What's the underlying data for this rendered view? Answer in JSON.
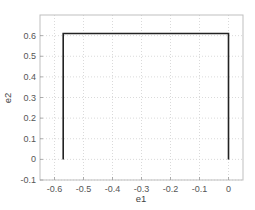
{
  "chart_data": {
    "type": "line",
    "title": "",
    "xlabel": "e1",
    "ylabel": "e2",
    "xlim": [
      -0.65,
      0.05
    ],
    "ylim": [
      -0.1,
      0.7
    ],
    "grid": true,
    "legend": null,
    "x_ticks": [
      -0.6,
      -0.5,
      -0.4,
      -0.3,
      -0.2,
      -0.1,
      0
    ],
    "x_tick_labels": [
      "-0.6",
      "-0.5",
      "-0.4",
      "-0.3",
      "-0.2",
      "-0.1",
      "0"
    ],
    "y_ticks": [
      -0.1,
      0,
      0.1,
      0.2,
      0.3,
      0.4,
      0.5,
      0.6
    ],
    "y_tick_labels": [
      "-0.1",
      "0",
      "0.1",
      "0.2",
      "0.3",
      "0.4",
      "0.5",
      "0.6"
    ],
    "series": [
      {
        "name": "path",
        "color": "#222222",
        "x": [
          -0.57,
          -0.57,
          0,
          0
        ],
        "y": [
          0,
          0.61,
          0.61,
          0
        ]
      }
    ]
  },
  "colors": {
    "frame": "#bfbfbf",
    "grid": "#d0d0d0",
    "line": "#222222",
    "text": "#555555"
  }
}
